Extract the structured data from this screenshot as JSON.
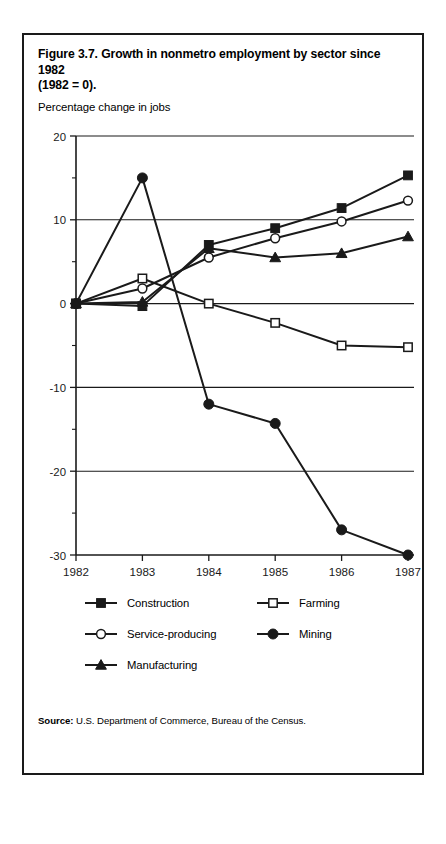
{
  "figure": {
    "title_line1": "Figure 3.7.  Growth in nonmetro employment by sector since 1982",
    "title_line2": "(1982 = 0).",
    "axis_caption": "Percentage change in jobs",
    "source_lead": "Source:",
    "source_text": "U.S. Department of Commerce, Bureau of the Census."
  },
  "chart_data": {
    "type": "line",
    "title": "Figure 3.7.  Growth in nonmetro employment by sector since 1982 (1982 = 0).",
    "xlabel": "",
    "ylabel": "Percentage change in jobs",
    "x": [
      1982,
      1983,
      1984,
      1985,
      1986,
      1987
    ],
    "xtick_labels": [
      "1982",
      "1983",
      "1984",
      "1985",
      "1986",
      "1987"
    ],
    "ylim": [
      -30,
      20
    ],
    "ytick_labels": [
      "20",
      "10",
      "0",
      "-10",
      "-20",
      "-30"
    ],
    "yticks": [
      20,
      10,
      0,
      -10,
      -20,
      -30
    ],
    "yminor_step": 5,
    "grid": "horizontal-major",
    "legend_position": "below-plot",
    "series": [
      {
        "name": "Construction",
        "marker": "filled-square",
        "values": [
          0,
          -0.3,
          7.0,
          9.0,
          11.4,
          15.3
        ]
      },
      {
        "name": "Farming",
        "marker": "open-square",
        "values": [
          0,
          3.0,
          0.0,
          -2.3,
          -5.0,
          -5.2
        ]
      },
      {
        "name": "Service-producing",
        "marker": "open-circle",
        "values": [
          0,
          1.8,
          5.5,
          7.8,
          9.8,
          12.3
        ]
      },
      {
        "name": "Mining",
        "marker": "filled-circle",
        "values": [
          0,
          15.0,
          -12.0,
          -14.3,
          -27.0,
          -30.0
        ]
      },
      {
        "name": "Manufacturing",
        "marker": "filled-triangle",
        "values": [
          0,
          0.2,
          6.6,
          5.5,
          6.0,
          8.0
        ]
      }
    ]
  },
  "legend": {
    "rows": [
      [
        {
          "label": "Construction",
          "marker": "filled-square"
        },
        {
          "label": "Farming",
          "marker": "open-square"
        }
      ],
      [
        {
          "label": "Service-producing",
          "marker": "open-circle"
        },
        {
          "label": "Mining",
          "marker": "filled-circle"
        }
      ],
      [
        {
          "label": "Manufacturing",
          "marker": "filled-triangle"
        }
      ]
    ]
  },
  "style": {
    "ink": "#1a1a1a",
    "paper": "#ffffff"
  }
}
